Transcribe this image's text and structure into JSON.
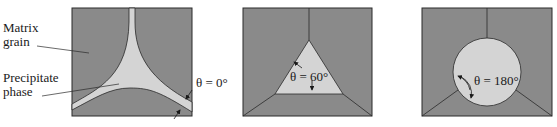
{
  "figure": {
    "colors": {
      "matrix": "#8a8a8a",
      "precipitate": "#d4d4d4",
      "line": "#2a2a2a",
      "text": "#1a1a1a",
      "background": "#ffffff"
    },
    "labels": {
      "matrix_grain_line1": "Matrix",
      "matrix_grain_line2": "grain",
      "precipitate_line1": "Precipitate",
      "precipitate_line2": "phase"
    },
    "panels": [
      {
        "id": "a",
        "dihedral_angle": "θ = 0°",
        "precipitate_shape": "continuous film along grain boundaries"
      },
      {
        "id": "b",
        "dihedral_angle": "θ = 60°",
        "precipitate_shape": "triangular at triple junction"
      },
      {
        "id": "c",
        "dihedral_angle": "θ = 180°",
        "precipitate_shape": "spherical at triple junction"
      }
    ]
  }
}
